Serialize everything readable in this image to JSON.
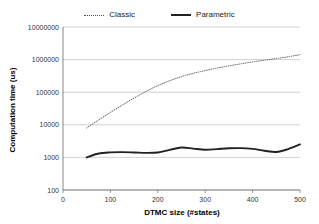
{
  "legend": {
    "position": "top-center",
    "entries": [
      {
        "label": "Classic",
        "style": "dotted",
        "color": "#555555"
      },
      {
        "label": "Parametric",
        "style": "solid",
        "color": "#222222"
      }
    ]
  },
  "chart_data": {
    "type": "line",
    "title": "",
    "subtitle": "",
    "xlabel": "DTMC size (#states)",
    "ylabel": "Computation time (us)",
    "xlim": [
      0,
      500
    ],
    "ylim": [
      100,
      10000000
    ],
    "yscale": "log",
    "xscale": "linear",
    "grid": "horizontal",
    "xticks": [
      0,
      100,
      200,
      300,
      400,
      500
    ],
    "xticklabels": [
      "0",
      "100",
      "200",
      "300",
      "400",
      "500"
    ],
    "yticks": [
      100,
      1000,
      10000,
      100000,
      1000000,
      10000000
    ],
    "yticklabels": [
      "100",
      "1000",
      "10000",
      "100000",
      "1000000",
      "10000000"
    ],
    "series": [
      {
        "name": "Classic",
        "style": "dotted",
        "color": "#555555",
        "x": [
          50,
          75,
          100,
          125,
          150,
          175,
          200,
          225,
          250,
          275,
          300,
          325,
          350,
          375,
          400,
          425,
          450,
          475,
          500
        ],
        "values": [
          8000,
          14000,
          24000,
          40000,
          66000,
          105000,
          160000,
          225000,
          300000,
          380000,
          460000,
          550000,
          640000,
          740000,
          850000,
          960000,
          1080000,
          1220000,
          1420000
        ]
      },
      {
        "name": "Parametric",
        "style": "solid",
        "color": "#222222",
        "x": [
          50,
          75,
          100,
          125,
          150,
          175,
          200,
          225,
          250,
          275,
          300,
          325,
          350,
          375,
          400,
          425,
          450,
          475,
          500
        ],
        "values": [
          1000,
          1320,
          1430,
          1450,
          1420,
          1380,
          1420,
          1700,
          2020,
          1860,
          1720,
          1800,
          1900,
          1920,
          1820,
          1600,
          1460,
          1800,
          2500
        ]
      }
    ],
    "annotations": []
  },
  "axis_titles": {
    "x": "DTMC size (#states)",
    "y": "Computation time (us)"
  }
}
